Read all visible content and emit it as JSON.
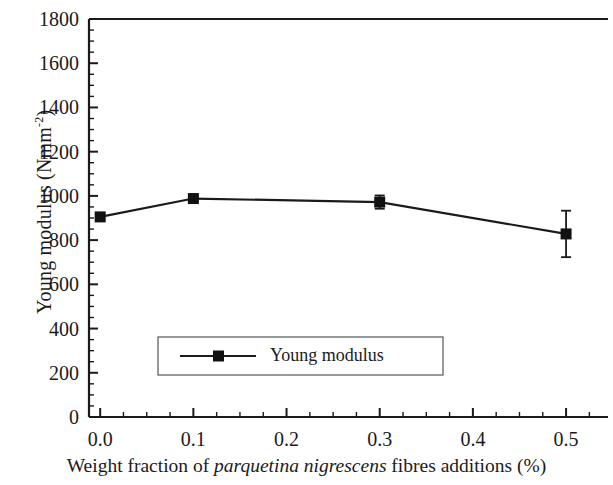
{
  "chart_data": {
    "type": "line",
    "title": "",
    "subtitle": "",
    "xlabel_parts": {
      "before": "Weight fraction of ",
      "italic": "parquetina nigrescens",
      "after": " fibres additions (%)"
    },
    "xlabel": "Weight fraction of parquetina nigrescens fibres additions (%)",
    "ylabel_parts": {
      "before": "Young modulus (Nmm",
      "sup": "-2",
      "after": ")"
    },
    "ylabel": "Young modulus (Nmm-2)",
    "x": [
      0.0,
      0.1,
      0.3,
      0.5
    ],
    "values": [
      905,
      988,
      972,
      828
    ],
    "series": [
      {
        "name": "Young modulus",
        "values": [
          905,
          988,
          972,
          828
        ],
        "errors": [
          8,
          12,
          30,
          105
        ]
      }
    ],
    "xlim": [
      -0.012,
      0.545
    ],
    "ylim": [
      0,
      1800
    ],
    "xticks": [
      0.0,
      0.1,
      0.2,
      0.3,
      0.4,
      0.5
    ],
    "xtick_labels": [
      "0.0",
      "0.1",
      "0.2",
      "0.3",
      "0.4",
      "0.5"
    ],
    "xminor_step": 0.025,
    "yticks": [
      0,
      200,
      400,
      600,
      800,
      1000,
      1200,
      1400,
      1600,
      1800
    ],
    "ytick_labels": [
      "0",
      "200",
      "400",
      "600",
      "800",
      "1000",
      "1200",
      "1400",
      "1600",
      "1800"
    ],
    "yminor_step": 50,
    "grid": false,
    "legend_position": "lower-center",
    "legend": [
      "Young modulus"
    ],
    "marker": "square",
    "line_color": "#1a1a1a",
    "marker_color": "#111111",
    "background_color": "#ffffff",
    "frame_color": "#1a1a1a"
  },
  "legend": {
    "entry_label": "Young modulus"
  }
}
